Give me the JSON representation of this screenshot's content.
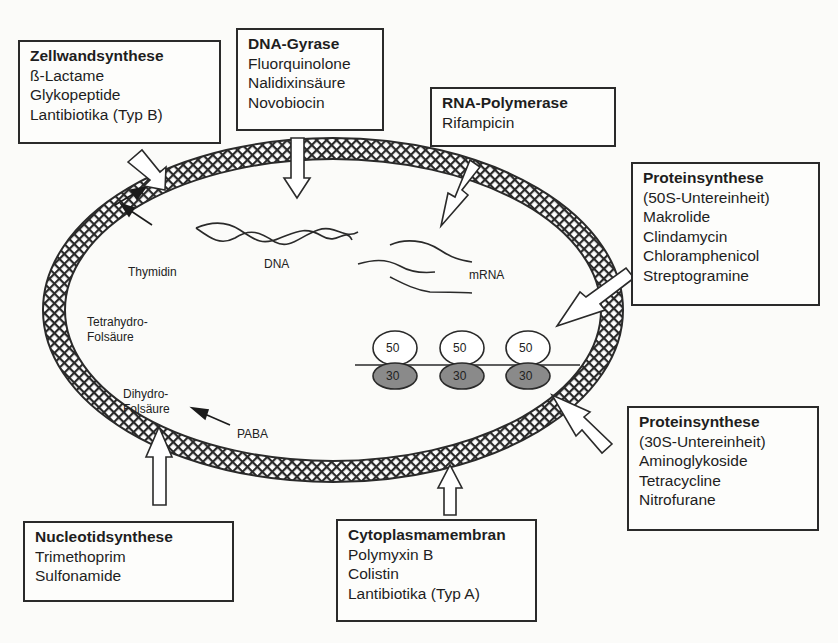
{
  "diagram": {
    "boxes": {
      "zellwand": {
        "title": "Zellwandsynthese",
        "items": [
          "ß-Lactame",
          "Glykopeptide",
          "Lantibiotika (Typ B)"
        ]
      },
      "gyrase": {
        "title": "DNA-Gyrase",
        "items": [
          "Fluorquinolone",
          "Nalidixinsäure",
          "Novobiocin"
        ]
      },
      "rnapol": {
        "title": "RNA-Polymerase",
        "items": [
          "Rifampicin"
        ]
      },
      "prot50": {
        "title": "Proteinsynthese",
        "items": [
          "(50S-Untereinheit)",
          "Makrolide",
          "Clindamycin",
          "Chloramphenicol",
          "Streptogramine"
        ]
      },
      "prot30": {
        "title": "Proteinsynthese",
        "items": [
          "(30S-Untereinheit)",
          "Aminoglykoside",
          "Tetracycline",
          "Nitrofurane"
        ]
      },
      "membran": {
        "title": "Cytoplasmamembran",
        "items": [
          "Polymyxin B",
          "Colistin",
          "Lantibiotika (Typ A)"
        ]
      },
      "nucleo": {
        "title": "Nucleotidsynthese",
        "items": [
          "Trimethoprim",
          "Sulfonamide"
        ]
      }
    },
    "labels": {
      "dna": "DNA",
      "mrna": "mRNA",
      "thymidin": "Thymidin",
      "thf_1": "Tetrahydro-",
      "thf_2": "Folsäure",
      "dhf_1": "Dihydro-",
      "dhf_2": "Folsäure",
      "paba": "PABA"
    },
    "ribosomes": [
      {
        "large": "50",
        "small": "30"
      },
      {
        "large": "50",
        "small": "30"
      },
      {
        "large": "50",
        "small": "30"
      }
    ],
    "colors": {
      "ink": "#2a2a2a",
      "small_subunit": "#8a8a8a",
      "paper": "#fbfbf9"
    }
  }
}
